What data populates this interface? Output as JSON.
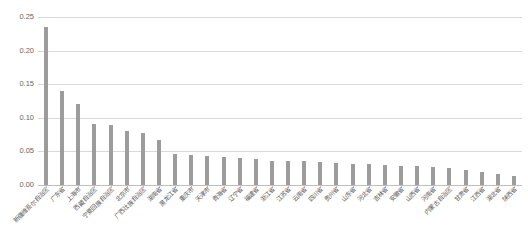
{
  "chart_data": {
    "type": "bar",
    "title": "",
    "subtitle": "",
    "xlabel": "",
    "ylabel": "",
    "ylim": [
      0,
      0.25
    ],
    "grid": true,
    "legend": "none",
    "bar_color": "#9c9c9c",
    "gridline_color": "#d9d9d9",
    "axis_label_color": "#676767",
    "ytick_labels": [
      "0.25",
      "0.20",
      "0.15",
      "0.10",
      "0.05",
      "0.00"
    ],
    "ytick_values": [
      0.25,
      0.2,
      0.15,
      0.1,
      0.05,
      0.0
    ],
    "categories": [
      "新疆维吾尔自治区",
      "广东省",
      "上海市",
      "西藏自治区",
      "宁夏回族自治区",
      "北京市",
      "广西壮族自治区",
      "湖南省",
      "黑龙江省",
      "重庆市",
      "天津市",
      "青海省",
      "辽宁省",
      "福建省",
      "浙江省",
      "江苏省",
      "云南省",
      "四川省",
      "贵州省",
      "山东省",
      "河北省",
      "吉林省",
      "安徽省",
      "山西省",
      "河南省",
      "内蒙古自治区",
      "甘肃省",
      "江西省",
      "湖北省",
      "陕西省"
    ],
    "values": [
      0.235,
      0.14,
      0.12,
      0.091,
      0.089,
      0.08,
      0.078,
      0.067,
      0.046,
      0.045,
      0.043,
      0.041,
      0.04,
      0.038,
      0.036,
      0.035,
      0.035,
      0.034,
      0.033,
      0.032,
      0.031,
      0.03,
      0.029,
      0.028,
      0.027,
      0.025,
      0.022,
      0.019,
      0.016,
      0.013
    ]
  }
}
